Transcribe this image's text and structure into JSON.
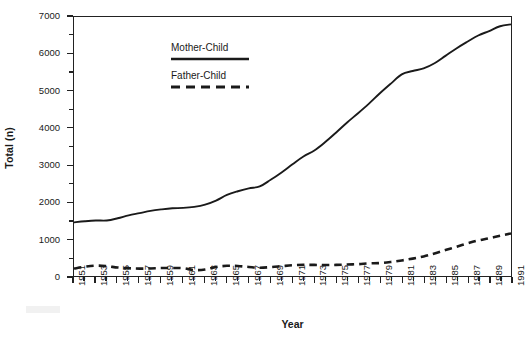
{
  "chart_data": {
    "type": "line",
    "title": "",
    "xlabel": "Year",
    "ylabel": "Total (n)",
    "xlim": [
      1951,
      1991
    ],
    "ylim": [
      0,
      7000
    ],
    "grid": false,
    "legend_position": "inside top-left",
    "y_ticks": [
      0,
      1000,
      2000,
      3000,
      4000,
      5000,
      6000,
      7000
    ],
    "y_tick_labels": [
      "0",
      "1000",
      "2000",
      "3000",
      "4000",
      "5000",
      "6000",
      "7000"
    ],
    "y_minor_tick_step": 500,
    "x_tick_labels": [
      "1951",
      "1953",
      "1955",
      "1957",
      "1959",
      "1961",
      "1963",
      "1965",
      "1967",
      "1969",
      "1971",
      "1973",
      "1975",
      "1977",
      "1979",
      "1981",
      "1983",
      "1985",
      "1987",
      "1989",
      "1991"
    ],
    "x_minor_tick_step": 1,
    "x": [
      1951,
      1952,
      1953,
      1954,
      1955,
      1956,
      1957,
      1958,
      1959,
      1960,
      1961,
      1962,
      1963,
      1964,
      1965,
      1966,
      1967,
      1968,
      1969,
      1970,
      1971,
      1972,
      1973,
      1974,
      1975,
      1976,
      1977,
      1978,
      1979,
      1980,
      1981,
      1982,
      1983,
      1984,
      1985,
      1986,
      1987,
      1988,
      1989,
      1990,
      1991
    ],
    "series": [
      {
        "name": "Mother-Child",
        "style": "solid",
        "color": "#1a1a1a",
        "values": [
          1450,
          1480,
          1500,
          1500,
          1560,
          1640,
          1700,
          1760,
          1800,
          1830,
          1840,
          1870,
          1930,
          2040,
          2190,
          2290,
          2370,
          2420,
          2600,
          2800,
          3020,
          3230,
          3390,
          3620,
          3880,
          4150,
          4400,
          4660,
          4940,
          5200,
          5450,
          5540,
          5610,
          5750,
          5950,
          6150,
          6330,
          6500,
          6620,
          6750,
          6800
        ]
      },
      {
        "name": "Father-Child",
        "style": "dashed",
        "color": "#1a1a1a",
        "values": [
          200,
          250,
          280,
          265,
          230,
          210,
          200,
          205,
          215,
          215,
          210,
          160,
          175,
          245,
          275,
          270,
          245,
          225,
          240,
          265,
          290,
          300,
          300,
          295,
          300,
          310,
          320,
          340,
          350,
          380,
          420,
          470,
          530,
          610,
          700,
          790,
          880,
          960,
          1020,
          1090,
          1150
        ]
      }
    ]
  },
  "legend": {
    "entries": [
      {
        "label": "Mother-Child",
        "style": "solid"
      },
      {
        "label": "Father-Child",
        "style": "dashed"
      }
    ]
  },
  "axes": {
    "y_title": "Total (n)",
    "x_title": "Year"
  }
}
